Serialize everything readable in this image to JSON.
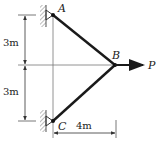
{
  "diagram": {
    "nodes": {
      "A": {
        "label": "A",
        "x": 53,
        "y": 15
      },
      "B": {
        "label": "B",
        "x": 115,
        "y": 65
      },
      "C": {
        "label": "C",
        "x": 53,
        "y": 121
      }
    },
    "members": [
      {
        "from": "A",
        "to": "B"
      },
      {
        "from": "C",
        "to": "B"
      }
    ],
    "load": {
      "label": "P",
      "direction": "right"
    },
    "dimensions": {
      "upper_vertical": "3m",
      "lower_vertical": "3m",
      "horizontal": "4m"
    },
    "colors": {
      "member": "#1a1a1a",
      "thin_line": "#555555",
      "hatch": "#777777"
    }
  }
}
